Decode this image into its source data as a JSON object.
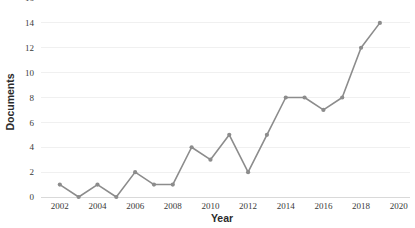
{
  "chart_data": {
    "type": "line",
    "title": "",
    "xlabel": "Year",
    "ylabel": "Documents",
    "x": [
      2002,
      2003,
      2004,
      2005,
      2006,
      2007,
      2008,
      2009,
      2010,
      2011,
      2012,
      2013,
      2014,
      2015,
      2016,
      2017,
      2018,
      2019
    ],
    "series": [
      {
        "name": "Documents",
        "values": [
          1,
          0,
          1,
          0,
          2,
          1,
          1,
          4,
          3,
          5,
          2,
          5,
          8,
          8,
          7,
          8,
          12,
          14
        ],
        "color": "#8c8c8c",
        "marker": "circle"
      }
    ],
    "xlim": [
      2001,
      2020.6
    ],
    "ylim": [
      0,
      16
    ],
    "xticks": [
      2002,
      2004,
      2006,
      2008,
      2010,
      2012,
      2014,
      2016,
      2018,
      2020
    ],
    "xtick_labels": [
      "2002",
      "2004",
      "2006",
      "2008",
      "2010",
      "2012",
      "2014",
      "2016",
      "2018",
      "2020"
    ],
    "yticks": [
      0,
      2,
      4,
      6,
      8,
      10,
      12,
      14,
      16
    ],
    "ytick_labels": [
      "0",
      "2",
      "4",
      "6",
      "8",
      "10",
      "12",
      "14",
      "16"
    ],
    "grid": true,
    "grid_axis": "y",
    "grid_color": "#f0f0f0",
    "legend": false,
    "legend_position": "none",
    "background_color": "#ffffff"
  },
  "axis_titles": {
    "x": "Year",
    "y": "Documents"
  }
}
